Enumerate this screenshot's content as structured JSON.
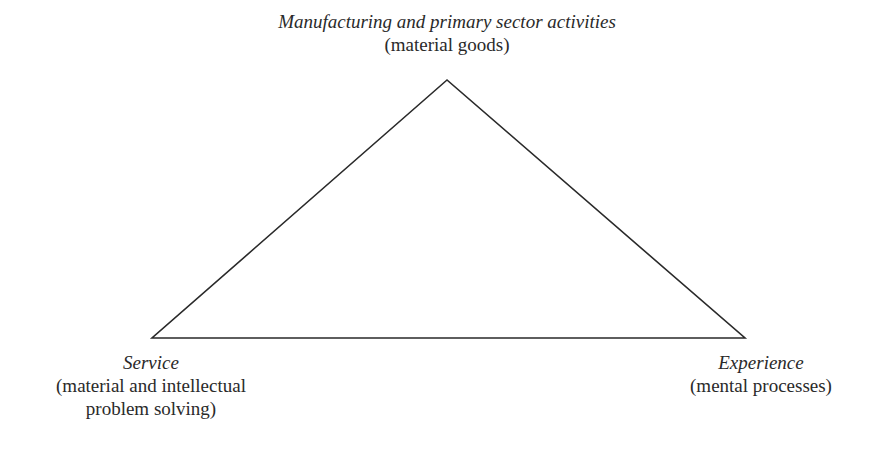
{
  "diagram": {
    "type": "triangle",
    "vertices": {
      "top": {
        "title": "Manufacturing and primary sector activities",
        "subtitle": "(material goods)"
      },
      "left": {
        "title": "Service",
        "subtitle_lines": [
          "(material and intellectual",
          "problem solving)"
        ]
      },
      "right": {
        "title": "Experience",
        "subtitle": "(mental processes)"
      }
    },
    "colors": {
      "line": "#2a2a2a",
      "background": "#ffffff"
    }
  }
}
